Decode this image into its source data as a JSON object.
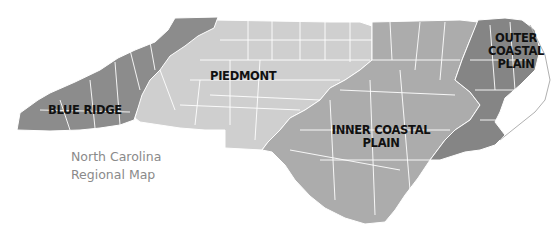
{
  "map": {
    "title_line1": "North Carolina",
    "title_line2": "Regional Map",
    "regions": [
      {
        "name": "BLUE RIDGE",
        "label_lines": [
          "BLUE RIDGE"
        ],
        "color": "#8c8c8c"
      },
      {
        "name": "PIEDMONT",
        "label_lines": [
          "PIEDMONT"
        ],
        "color": "#cfcfcf"
      },
      {
        "name": "INNER COASTAL PLAIN",
        "label_lines": [
          "INNER COASTAL",
          "PLAIN"
        ],
        "color": "#acacac"
      },
      {
        "name": "OUTER COASTAL PLAIN",
        "label_lines": [
          "OUTER",
          "COASTAL",
          "PLAIN"
        ],
        "color": "#858585"
      }
    ],
    "county_border_color": "#ffffff",
    "title_color": "#8a8a8a"
  }
}
